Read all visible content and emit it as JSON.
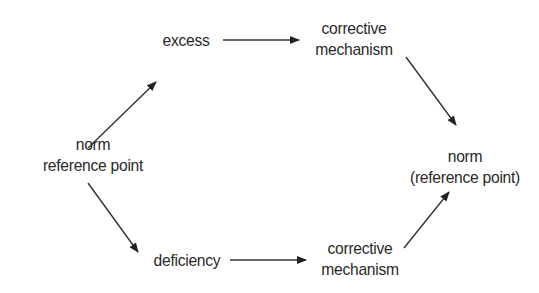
{
  "diagram": {
    "nodes": {
      "norm_left": {
        "line1": "norm",
        "line2": "reference point"
      },
      "excess": {
        "label": "excess"
      },
      "deficiency": {
        "label": "deficiency"
      },
      "corrective_top": {
        "line1": "corrective",
        "line2": "mechanism"
      },
      "corrective_bottom": {
        "line1": "corrective",
        "line2": "mechanism"
      },
      "norm_right": {
        "line1": "norm",
        "line2": "(reference point)"
      }
    },
    "edges": [
      {
        "from": "norm_left",
        "to": "excess"
      },
      {
        "from": "excess",
        "to": "corrective_top"
      },
      {
        "from": "corrective_top",
        "to": "norm_right"
      },
      {
        "from": "norm_left",
        "to": "deficiency"
      },
      {
        "from": "deficiency",
        "to": "corrective_bottom"
      },
      {
        "from": "corrective_bottom",
        "to": "norm_right"
      }
    ],
    "colors": {
      "line": "#222222",
      "text": "#2a2a2a",
      "background": "#ffffff"
    }
  }
}
